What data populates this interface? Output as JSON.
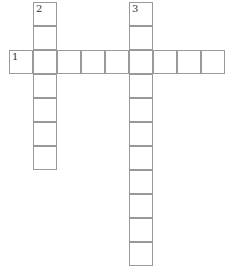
{
  "puzzle": {
    "cell_size": 24,
    "origin_x": 9,
    "origin_y": 2,
    "grid_color": "#9a9a9a",
    "words": [
      {
        "number": "1",
        "direction": "across",
        "row": 2,
        "col": 0,
        "length": 9
      },
      {
        "number": "2",
        "direction": "down",
        "row": 0,
        "col": 1,
        "length": 7
      },
      {
        "number": "3",
        "direction": "down",
        "row": 0,
        "col": 5,
        "length": 11
      }
    ]
  }
}
